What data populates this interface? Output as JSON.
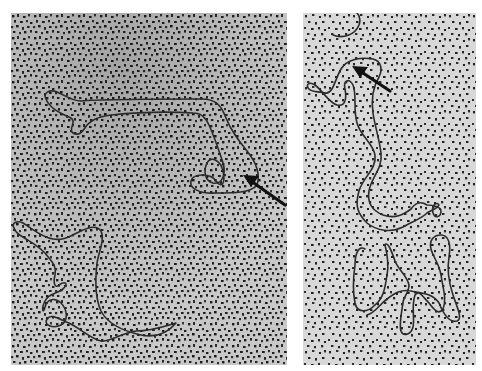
{
  "figure": {
    "background_color": "#ffffff",
    "panels": [
      {
        "id": "left",
        "field_color": "#c9c9c9",
        "speckle_color": "#1e1e1e",
        "strand_color": "#2a2a2a",
        "molecules": 2,
        "arrow": {
          "tip": [
            232,
            162
          ],
          "tail": [
            274,
            192
          ],
          "direction": "pointing up-left"
        }
      },
      {
        "id": "right",
        "field_color": "#d6d6d6",
        "speckle_color": "#1e1e1e",
        "strand_color": "#2a2a2a",
        "molecules": 3,
        "arrow": {
          "tip": [
            49,
            53
          ],
          "tail": [
            87,
            78
          ],
          "direction": "pointing up-left"
        }
      }
    ],
    "text": []
  }
}
